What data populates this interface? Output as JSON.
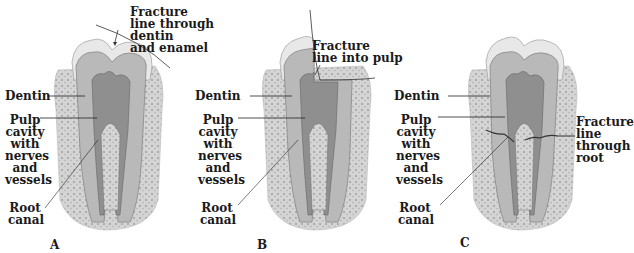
{
  "figure": {
    "panels": [
      {
        "id": "A",
        "label": "A",
        "fracture_label": "Fracture\nline through\ndentin\nand enamel",
        "labels": {
          "dentin": "Dentin",
          "pulp": "Pulp\ncavity\nwith\nnerves\nand\nvessels",
          "root_canal": "Root\ncanal"
        }
      },
      {
        "id": "B",
        "label": "B",
        "fracture_label": "Fracture\nline into pulp",
        "labels": {
          "dentin": "Dentin",
          "pulp": "Pulp\ncavity\nwith\nnerves\nand\nvessels",
          "root_canal": "Root\ncanal"
        }
      },
      {
        "id": "C",
        "label": "C",
        "fracture_label": "Fracture\nline\nthrough\nroot",
        "labels": {
          "dentin": "Dentin",
          "pulp": "Pulp\ncavity\nwith\nnerves\nand\nvessels",
          "root_canal": "Root\ncanal"
        }
      }
    ]
  },
  "colors": {
    "enamel": "#e6e6e6",
    "dentin": "#b8b8b8",
    "pulp": "#8e8e8e",
    "bone": "#cfcfcf",
    "line": "#222222"
  }
}
